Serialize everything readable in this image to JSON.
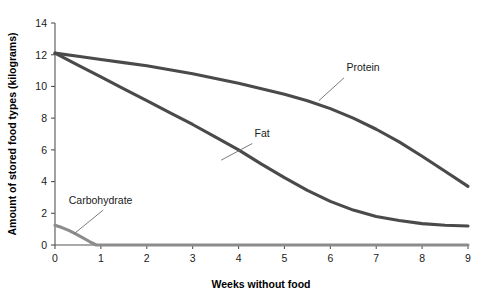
{
  "chart_data": {
    "type": "line",
    "title": "",
    "xlabel": "Weeks without food",
    "ylabel": "Amount of stored food types (kilograms)",
    "xlim": [
      0,
      9
    ],
    "ylim": [
      0,
      14
    ],
    "xticks": [
      "0",
      "1",
      "2",
      "3",
      "4",
      "5",
      "6",
      "7",
      "8",
      "9"
    ],
    "yticks": [
      "0",
      "2",
      "4",
      "6",
      "8",
      "10",
      "12",
      "14"
    ],
    "grid": false,
    "legend": "inline-annotations",
    "line_color": "#4a4a4a",
    "carb_color": "#8c8c8c",
    "series": [
      {
        "name": "Protein",
        "label_x": 6.35,
        "label_y": 11.0,
        "x": [
          0,
          0.5,
          1,
          1.5,
          2,
          2.5,
          3,
          3.5,
          4,
          4.5,
          5,
          5.5,
          6,
          6.5,
          7,
          7.5,
          8,
          8.5,
          9
        ],
        "values": [
          12.1,
          11.9,
          11.7,
          11.5,
          11.3,
          11.05,
          10.8,
          10.5,
          10.2,
          9.85,
          9.5,
          9.1,
          8.6,
          8.0,
          7.3,
          6.5,
          5.6,
          4.65,
          3.7
        ]
      },
      {
        "name": "Fat",
        "label_x": 4.35,
        "label_y": 6.8,
        "x": [
          0,
          0.5,
          1,
          1.5,
          2,
          2.5,
          3,
          3.5,
          4,
          4.5,
          5,
          5.5,
          6,
          6.5,
          7,
          7.5,
          8,
          8.5,
          9
        ],
        "values": [
          12.1,
          11.35,
          10.6,
          9.85,
          9.1,
          8.35,
          7.6,
          6.8,
          6.0,
          5.1,
          4.25,
          3.45,
          2.75,
          2.2,
          1.8,
          1.55,
          1.35,
          1.25,
          1.2
        ]
      },
      {
        "name": "Carbohydrate",
        "label_x": 0.3,
        "label_y": 2.6,
        "x": [
          0,
          0.15,
          0.3,
          0.45,
          0.6,
          0.75,
          0.9,
          9
        ],
        "values": [
          1.25,
          1.1,
          0.92,
          0.7,
          0.46,
          0.22,
          0.0,
          0.0
        ]
      }
    ],
    "annotations": [
      {
        "name": "protein-leader",
        "from_x": 6.3,
        "from_y": 10.55,
        "to_x": 5.75,
        "to_y": 9.1
      },
      {
        "name": "fat-leader",
        "from_x": 4.3,
        "from_y": 6.4,
        "to_x": 3.62,
        "to_y": 5.35
      },
      {
        "name": "carbohydrate-leader",
        "from_x": 1.05,
        "from_y": 2.2,
        "to_x": 0.42,
        "to_y": 0.72
      }
    ]
  }
}
